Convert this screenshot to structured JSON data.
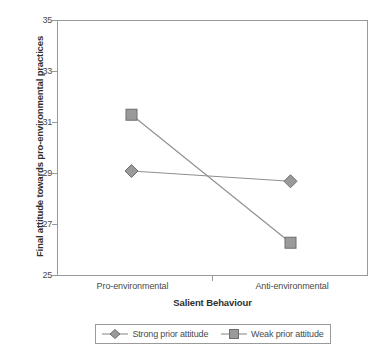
{
  "chart_data": {
    "type": "line",
    "title": "",
    "xlabel": "Salient Behaviour",
    "ylabel": "Final attitude towards pro-environmental practices",
    "categories": [
      "Pro-environmental",
      "Anti-environmental"
    ],
    "ylim": [
      25,
      35
    ],
    "yticks": [
      25,
      27,
      29,
      31,
      33,
      35
    ],
    "ytick_labels": [
      "25",
      "27",
      "29",
      "31",
      "33",
      "35"
    ],
    "grid": false,
    "legend_position": "bottom",
    "series": [
      {
        "name": "Strong prior attitude",
        "marker": "diamond",
        "color": "#999999",
        "values": [
          29.1,
          28.7
        ]
      },
      {
        "name": "Weak prior attitude",
        "marker": "square",
        "color": "#999999",
        "values": [
          31.3,
          26.3
        ]
      }
    ]
  },
  "axes": {
    "y_title": "Final attitude towards pro-environmental practices",
    "x_title": "Salient Behaviour",
    "y_tick_labels": [
      "35",
      "33",
      "31",
      "29",
      "27",
      "25"
    ],
    "x_tick_labels": [
      "Pro-environmental",
      "Anti-environmental"
    ]
  },
  "legend": {
    "items": [
      {
        "label": "Strong prior attitude",
        "marker": "diamond-marker"
      },
      {
        "label": "Weak prior attitude",
        "marker": "square-marker"
      }
    ]
  },
  "colors": {
    "marker_fill": "#999999",
    "marker_stroke": "#6e6e6e",
    "line": "#8f8f8f",
    "frame": "#9a9a9a",
    "text": "#4a4a4a",
    "title_text": "#2f2f2f"
  }
}
